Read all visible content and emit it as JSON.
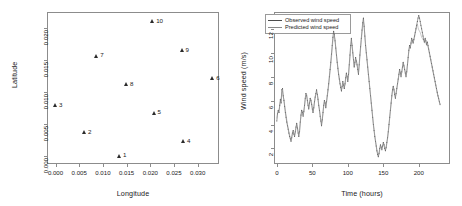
{
  "figure": {
    "panels": [
      "scatter",
      "timeseries"
    ]
  },
  "chart_data": [
    {
      "type": "scatter",
      "title": "",
      "xlabel": "Longitude",
      "ylabel": "Latitude",
      "xlim": [
        -0.0018,
        0.0345
      ],
      "ylim": [
        -0.0012,
        0.0225
      ],
      "xticks": [
        0.0,
        0.005,
        0.01,
        0.015,
        0.02,
        0.025,
        0.03
      ],
      "xticklabels": [
        "0.000",
        "0.005",
        "0.010",
        "0.015",
        "0.020",
        "0.025",
        "0.030"
      ],
      "yticks": [
        0.0,
        0.005,
        0.01,
        0.015,
        0.02
      ],
      "yticklabels": [
        "0.000",
        "0.005",
        "0.010",
        "0.015",
        "0.020"
      ],
      "grid": false,
      "legend": "none",
      "marker": "triangle",
      "points": [
        {
          "label": "1",
          "x": 0.0135,
          "y": 0.0001
        },
        {
          "label": "2",
          "x": 0.0061,
          "y": 0.0037
        },
        {
          "label": "3",
          "x": 0.0,
          "y": 0.008
        },
        {
          "label": "4",
          "x": 0.027,
          "y": 0.0024
        },
        {
          "label": "5",
          "x": 0.0208,
          "y": 0.0068
        },
        {
          "label": "6",
          "x": 0.0332,
          "y": 0.0122
        },
        {
          "label": "7",
          "x": 0.0087,
          "y": 0.0157
        },
        {
          "label": "8",
          "x": 0.015,
          "y": 0.0112
        },
        {
          "label": "9",
          "x": 0.0267,
          "y": 0.0165
        },
        {
          "label": "10",
          "x": 0.0205,
          "y": 0.0211
        }
      ]
    },
    {
      "type": "line",
      "title": "",
      "xlabel": "Time (hours)",
      "ylabel": "Wind speed (m/s)",
      "xlim": [
        -4,
        244
      ],
      "ylim": [
        0.7,
        13.4
      ],
      "xticks": [
        0,
        50,
        100,
        150,
        200
      ],
      "xticklabels": [
        "0",
        "50",
        "100",
        "150",
        "200"
      ],
      "yticks": [
        2,
        4,
        6,
        8,
        10,
        12
      ],
      "yticklabels": [
        "2",
        "4",
        "6",
        "8",
        "10",
        "12"
      ],
      "grid": false,
      "legend_position": "top-left",
      "series": [
        {
          "name": "Observed wind speed",
          "color": "#4d4d4d",
          "style": "solid-with-points",
          "x": [
            0,
            1,
            2,
            3,
            4,
            5,
            6,
            7,
            8,
            9,
            10,
            11,
            12,
            13,
            14,
            15,
            16,
            17,
            18,
            19,
            20,
            21,
            22,
            23,
            24,
            25,
            26,
            27,
            28,
            29,
            30,
            31,
            32,
            33,
            34,
            35,
            36,
            37,
            38,
            39,
            40,
            41,
            42,
            43,
            44,
            45,
            46,
            47,
            48,
            49,
            50,
            51,
            52,
            53,
            54,
            55,
            56,
            57,
            58,
            59,
            60,
            61,
            62,
            63,
            64,
            65,
            66,
            67,
            68,
            69,
            70,
            71,
            72,
            73,
            74,
            75,
            76,
            77,
            78,
            79,
            80,
            81,
            82,
            83,
            84,
            85,
            86,
            87,
            88,
            89,
            90,
            91,
            92,
            93,
            94,
            95,
            96,
            97,
            98,
            99,
            100,
            101,
            102,
            103,
            104,
            105,
            106,
            107,
            108,
            109,
            110,
            111,
            112,
            113,
            114,
            115,
            116,
            117,
            118,
            119,
            120,
            121,
            122,
            123,
            124,
            125,
            126,
            127,
            128,
            129,
            130,
            131,
            132,
            133,
            134,
            135,
            136,
            137,
            138,
            139,
            140,
            141,
            142,
            143,
            144,
            145,
            146,
            147,
            148,
            149,
            150,
            151,
            152,
            153,
            154,
            155,
            156,
            157,
            158,
            159,
            160,
            161,
            162,
            163,
            164,
            165,
            166,
            167,
            168,
            169,
            170,
            171,
            172,
            173,
            174,
            175,
            176,
            177,
            178,
            179,
            180,
            181,
            182,
            183,
            184,
            185,
            186,
            187,
            188,
            189,
            190,
            191,
            192,
            193,
            194,
            195,
            196,
            197,
            198,
            199,
            200,
            201,
            202,
            203,
            204,
            205,
            206,
            207,
            208,
            209,
            210,
            211,
            212,
            213,
            214,
            215,
            216,
            217,
            218,
            219,
            220,
            221,
            222,
            223,
            224,
            225,
            226,
            227,
            228,
            229,
            230,
            231,
            232,
            233,
            234,
            235,
            236,
            237,
            238,
            239
          ],
          "y": [
            4.3,
            4.9,
            5.2,
            5.0,
            5.6,
            6.1,
            5.8,
            6.9,
            7.0,
            6.4,
            6.0,
            5.5,
            5.0,
            4.6,
            4.2,
            3.9,
            3.6,
            3.3,
            3.0,
            2.8,
            2.6,
            2.9,
            3.3,
            3.5,
            3.2,
            3.0,
            3.4,
            3.8,
            4.1,
            3.7,
            3.3,
            3.0,
            3.4,
            4.2,
            4.8,
            5.2,
            5.0,
            4.7,
            5.1,
            5.6,
            6.2,
            6.6,
            6.4,
            6.0,
            5.6,
            5.3,
            5.8,
            6.2,
            6.0,
            5.7,
            5.3,
            5.0,
            5.4,
            5.9,
            6.3,
            6.6,
            6.9,
            6.5,
            6.1,
            5.6,
            5.2,
            4.7,
            4.3,
            3.9,
            4.4,
            5.0,
            5.6,
            6.0,
            5.8,
            5.4,
            5.9,
            6.4,
            6.9,
            7.4,
            8.0,
            8.6,
            9.2,
            9.9,
            10.6,
            11.3,
            11.8,
            11.5,
            11.0,
            10.4,
            9.8,
            9.2,
            8.7,
            8.2,
            7.8,
            7.4,
            7.1,
            6.8,
            7.2,
            7.6,
            7.3,
            7.0,
            7.4,
            7.9,
            8.3,
            8.0,
            7.6,
            8.2,
            9.0,
            9.8,
            10.6,
            11.2,
            10.6,
            10.0,
            9.4,
            8.8,
            9.2,
            9.6,
            9.3,
            9.0,
            8.6,
            8.2,
            9.0,
            9.8,
            10.5,
            11.2,
            11.9,
            12.5,
            12.9,
            12.2,
            11.4,
            10.6,
            10.0,
            9.4,
            8.8,
            8.2,
            7.6,
            7.0,
            6.4,
            5.8,
            5.2,
            4.6,
            4.0,
            3.5,
            3.0,
            2.6,
            2.2,
            1.8,
            1.5,
            1.3,
            1.6,
            2.0,
            2.3,
            2.1,
            1.9,
            2.2,
            2.5,
            2.3,
            2.0,
            1.8,
            2.1,
            2.5,
            2.9,
            3.4,
            4.0,
            4.6,
            5.2,
            5.8,
            6.4,
            6.9,
            7.2,
            6.9,
            6.5,
            6.2,
            6.6,
            7.0,
            7.4,
            7.8,
            8.2,
            8.6,
            8.3,
            8.0,
            8.4,
            8.8,
            9.2,
            8.9,
            8.6,
            8.3,
            8.0,
            8.4,
            9.0,
            9.6,
            10.2,
            10.6,
            10.4,
            10.8,
            11.2,
            11.0,
            10.8,
            11.1,
            11.4,
            11.7,
            12.0,
            12.3,
            12.6,
            12.9,
            13.1,
            12.9,
            12.6,
            12.3,
            12.0,
            11.7,
            11.4,
            11.1,
            10.9,
            11.2,
            11.0,
            10.7,
            10.9,
            10.6,
            10.3,
            10.0,
            9.7,
            9.4,
            9.1,
            8.8,
            8.5,
            8.2,
            7.9,
            7.6,
            7.3,
            7.0,
            6.7,
            6.4,
            6.2,
            5.9,
            5.7
          ]
        },
        {
          "name": "Predicted wind speed",
          "color": "#8a8a8a",
          "style": "solid",
          "x": [
            0,
            1,
            2,
            3,
            4,
            5,
            6,
            7,
            8,
            9,
            10,
            11,
            12,
            13,
            14,
            15,
            16,
            17,
            18,
            19,
            20,
            21,
            22,
            23,
            24,
            25,
            26,
            27,
            28,
            29,
            30,
            31,
            32,
            33,
            34,
            35,
            36,
            37,
            38,
            39,
            40,
            41,
            42,
            43,
            44,
            45,
            46,
            47,
            48,
            49,
            50,
            51,
            52,
            53,
            54,
            55,
            56,
            57,
            58,
            59,
            60,
            61,
            62,
            63,
            64,
            65,
            66,
            67,
            68,
            69,
            70,
            71,
            72,
            73,
            74,
            75,
            76,
            77,
            78,
            79,
            80,
            81,
            82,
            83,
            84,
            85,
            86,
            87,
            88,
            89,
            90,
            91,
            92,
            93,
            94,
            95,
            96,
            97,
            98,
            99,
            100,
            101,
            102,
            103,
            104,
            105,
            106,
            107,
            108,
            109,
            110,
            111,
            112,
            113,
            114,
            115,
            116,
            117,
            118,
            119,
            120,
            121,
            122,
            123,
            124,
            125,
            126,
            127,
            128,
            129,
            130,
            131,
            132,
            133,
            134,
            135,
            136,
            137,
            138,
            139,
            140,
            141,
            142,
            143,
            144,
            145,
            146,
            147,
            148,
            149,
            150,
            151,
            152,
            153,
            154,
            155,
            156,
            157,
            158,
            159,
            160,
            161,
            162,
            163,
            164,
            165,
            166,
            167,
            168,
            169,
            170,
            171,
            172,
            173,
            174,
            175,
            176,
            177,
            178,
            179,
            180,
            181,
            182,
            183,
            184,
            185,
            186,
            187,
            188,
            189,
            190,
            191,
            192,
            193,
            194,
            195,
            196,
            197,
            198,
            199,
            200,
            201,
            202,
            203,
            204,
            205,
            206,
            207,
            208,
            209,
            210,
            211,
            212,
            213,
            214,
            215,
            216,
            217,
            218,
            219,
            220,
            221,
            222,
            223,
            224,
            225,
            226,
            227,
            228,
            229,
            230,
            231,
            232,
            233,
            234,
            235,
            236,
            237,
            238,
            239
          ],
          "y": [
            4.5,
            5.0,
            5.1,
            5.2,
            5.5,
            5.9,
            6.0,
            6.7,
            6.8,
            6.3,
            6.1,
            5.6,
            5.2,
            4.8,
            4.4,
            4.0,
            3.7,
            3.4,
            3.1,
            2.9,
            2.7,
            3.0,
            3.2,
            3.4,
            3.3,
            3.1,
            3.3,
            3.7,
            4.0,
            3.8,
            3.4,
            3.2,
            3.5,
            4.1,
            4.7,
            5.0,
            5.1,
            4.8,
            5.0,
            5.5,
            6.0,
            6.4,
            6.5,
            6.1,
            5.7,
            5.4,
            5.7,
            6.0,
            6.1,
            5.8,
            5.4,
            5.1,
            5.3,
            5.8,
            6.2,
            6.5,
            6.7,
            6.6,
            6.2,
            5.7,
            5.3,
            4.9,
            4.5,
            4.1,
            4.3,
            4.9,
            5.5,
            5.9,
            5.9,
            5.5,
            5.8,
            6.3,
            6.7,
            7.2,
            7.8,
            8.4,
            9.0,
            9.6,
            10.3,
            11.0,
            11.4,
            11.4,
            11.1,
            10.5,
            9.9,
            9.3,
            8.8,
            8.3,
            7.9,
            7.5,
            7.2,
            6.9,
            7.1,
            7.4,
            7.4,
            7.1,
            7.3,
            7.7,
            8.1,
            8.1,
            7.7,
            8.0,
            8.8,
            9.5,
            10.3,
            10.9,
            10.7,
            10.1,
            9.5,
            8.9,
            9.0,
            9.4,
            9.4,
            9.1,
            8.7,
            8.3,
            8.8,
            9.6,
            10.3,
            11.0,
            11.6,
            12.2,
            12.6,
            12.3,
            11.5,
            10.7,
            10.1,
            9.5,
            8.9,
            8.3,
            7.7,
            7.1,
            6.5,
            5.9,
            5.3,
            4.7,
            4.1,
            3.6,
            3.1,
            2.7,
            2.3,
            1.9,
            1.6,
            1.4,
            1.5,
            1.9,
            2.2,
            2.2,
            2.0,
            2.1,
            2.4,
            2.4,
            2.1,
            1.9,
            2.0,
            2.4,
            2.8,
            3.3,
            3.9,
            4.5,
            5.1,
            5.7,
            6.3,
            6.8,
            7.1,
            7.0,
            6.6,
            6.3,
            6.5,
            6.9,
            7.3,
            7.7,
            8.1,
            8.5,
            8.4,
            8.1,
            8.3,
            8.7,
            9.1,
            9.0,
            8.7,
            8.4,
            8.1,
            8.3,
            8.9,
            9.5,
            10.1,
            10.5,
            10.5,
            10.7,
            11.1,
            11.1,
            10.9,
            11.0,
            11.3,
            11.6,
            11.9,
            12.2,
            12.4,
            12.1,
            11.9,
            11.8,
            11.7,
            11.5,
            11.3,
            11.2,
            11.1,
            11.0,
            10.8,
            11.0,
            10.9,
            10.6,
            10.7,
            10.5,
            10.2,
            9.9,
            9.6,
            9.3,
            9.0,
            8.7,
            8.4,
            8.1,
            7.8,
            7.5,
            7.2,
            6.9,
            6.6,
            6.4,
            6.1,
            5.9,
            5.6
          ]
        }
      ]
    }
  ]
}
